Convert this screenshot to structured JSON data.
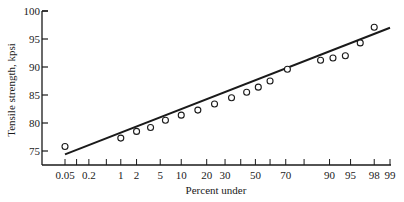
{
  "chart_data": {
    "type": "scatter",
    "title": "",
    "xlabel": "Percent under",
    "ylabel": "Tensile strength, kpsi",
    "x_scale": "normal-probability",
    "x_ticks": [
      0.05,
      0.1,
      0.2,
      0.5,
      1,
      2,
      5,
      10,
      20,
      30,
      40,
      50,
      60,
      70,
      80,
      90,
      95,
      98,
      99
    ],
    "x_tick_labels": [
      "0.05",
      "0.2",
      "1",
      "2",
      "5",
      "10",
      "20",
      "30",
      "50",
      "70",
      "90",
      "95",
      "98",
      "99"
    ],
    "y_ticks": [
      75,
      80,
      85,
      90,
      95,
      100
    ],
    "ylim": [
      73,
      100
    ],
    "grid": false,
    "series": [
      {
        "name": "observations",
        "marker": "open-circle",
        "points": [
          {
            "x": 0.05,
            "y": 75.8
          },
          {
            "x": 1,
            "y": 77.3
          },
          {
            "x": 2,
            "y": 78.5
          },
          {
            "x": 3.5,
            "y": 79.2
          },
          {
            "x": 6,
            "y": 80.5
          },
          {
            "x": 10,
            "y": 81.4
          },
          {
            "x": 16,
            "y": 82.3
          },
          {
            "x": 24,
            "y": 83.4
          },
          {
            "x": 34,
            "y": 84.5
          },
          {
            "x": 44,
            "y": 85.5
          },
          {
            "x": 52,
            "y": 86.4
          },
          {
            "x": 60,
            "y": 87.5
          },
          {
            "x": 71,
            "y": 89.6
          },
          {
            "x": 87,
            "y": 91.2
          },
          {
            "x": 91,
            "y": 91.6
          },
          {
            "x": 94,
            "y": 92.0
          },
          {
            "x": 96.5,
            "y": 94.3
          },
          {
            "x": 98,
            "y": 97.1
          }
        ]
      },
      {
        "name": "fitted line",
        "type": "line",
        "points": [
          {
            "x": 0.05,
            "y": 74.4
          },
          {
            "x": 99,
            "y": 97.0
          }
        ]
      }
    ]
  }
}
